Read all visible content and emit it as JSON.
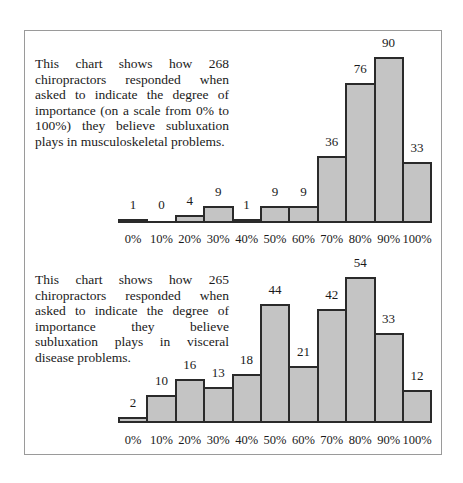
{
  "chart_data": [
    {
      "type": "bar",
      "title": "This chart shows how 268 chiropractors responded when asked to indicate the degree of importance (on a scale from 0% to 100%) they believe subluxation plays in musculoskeletal problems.",
      "categories": [
        "0%",
        "10%",
        "20%",
        "30%",
        "40%",
        "50%",
        "60%",
        "70%",
        "80%",
        "90%",
        "100%"
      ],
      "values": [
        1,
        0,
        4,
        9,
        1,
        9,
        9,
        36,
        76,
        90,
        33
      ],
      "xlabel": "",
      "ylabel": "",
      "ylim": [
        0,
        90
      ],
      "grid": false,
      "legend": null
    },
    {
      "type": "bar",
      "title": "This chart shows how 265 chiropractors responded when asked to indicate the degree of importance they believe subluxation plays in visceral disease problems.",
      "categories": [
        "0%",
        "10%",
        "20%",
        "30%",
        "40%",
        "50%",
        "60%",
        "70%",
        "80%",
        "90%",
        "100%"
      ],
      "values": [
        2,
        10,
        16,
        13,
        18,
        44,
        21,
        42,
        54,
        33,
        12
      ],
      "xlabel": "",
      "ylabel": "",
      "ylim": [
        0,
        54
      ],
      "grid": false,
      "legend": null
    }
  ],
  "charts": [
    {
      "description": "This chart shows how 268 chiropractors responded when asked to indicate the degree of importance (on a scale from 0% to 100%) they believe subluxation plays in musculoskeletal problems."
    },
    {
      "description": "This chart shows how 265 chiropractors responded when asked to indicate the degree of importance they believe subluxation plays in visceral disease problems."
    }
  ]
}
